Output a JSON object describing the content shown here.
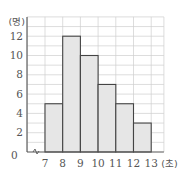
{
  "chart_data": {
    "type": "bar",
    "subtype": "histogram",
    "title": "",
    "xlabel": "(초)",
    "ylabel": "(명)",
    "bins": [
      [
        7,
        8
      ],
      [
        8,
        9
      ],
      [
        9,
        10
      ],
      [
        10,
        11
      ],
      [
        11,
        12
      ],
      [
        12,
        13
      ]
    ],
    "categories": [
      "7~8",
      "8~9",
      "9~10",
      "10~11",
      "11~12",
      "12~13"
    ],
    "values": [
      5,
      12,
      10,
      7,
      5,
      3
    ],
    "x_ticks": [
      "7",
      "8",
      "9",
      "10",
      "11",
      "12",
      "13"
    ],
    "y_ticks": [
      "2",
      "4",
      "6",
      "8",
      "10",
      "12"
    ],
    "origin_label": "0",
    "ylim": [
      0,
      14
    ],
    "xlim": [
      7,
      14
    ],
    "grid": true,
    "axis_break": true,
    "legend": null
  },
  "colors": {
    "bar_fill": "#e6e6e6",
    "bar_stroke": "#444444",
    "grid": "#cfcfcf",
    "axis": "#555555",
    "text": "#555555"
  }
}
